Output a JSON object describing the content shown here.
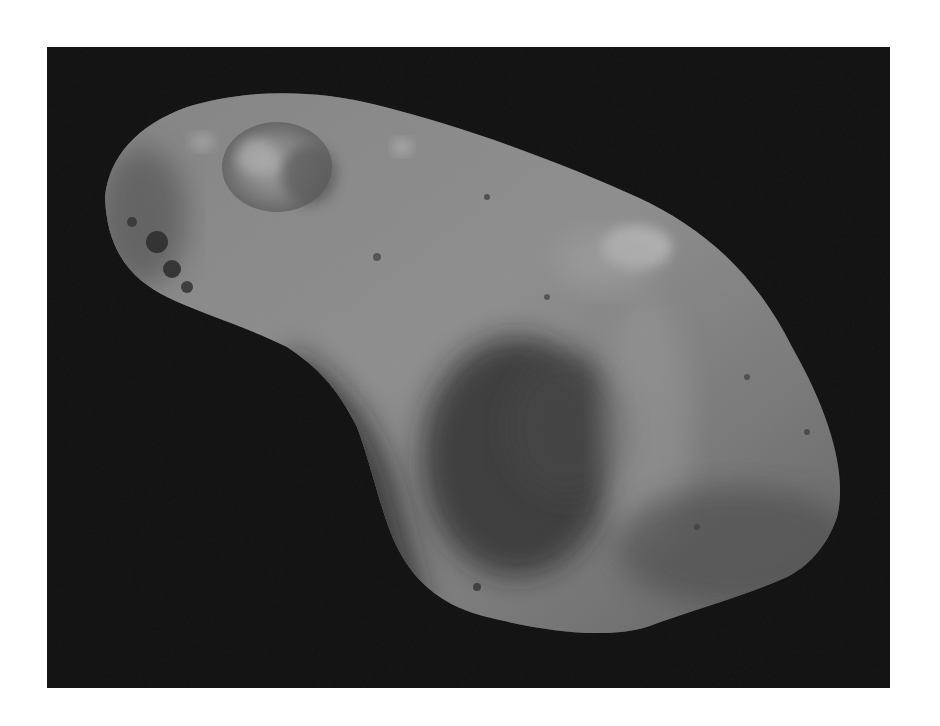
{
  "image": {
    "subject": "Asteroid (grayscale space photograph)",
    "alt": "Grayscale photograph of an elongated, cratered asteroid against a black background",
    "colors": {
      "page_background": "#ffffff",
      "space_background": "#111111",
      "surface_light": "#9a9a9a",
      "surface_mid": "#6e6e6e",
      "surface_shadow": "#2a2a2a"
    }
  }
}
